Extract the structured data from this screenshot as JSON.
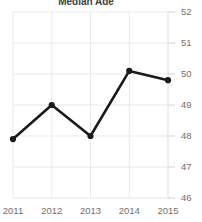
{
  "chart_data": {
    "type": "line",
    "title": "Median Age",
    "categories": [
      "2011",
      "2012",
      "2013",
      "2014",
      "2015"
    ],
    "x": [
      2011,
      2012,
      2013,
      2014,
      2015
    ],
    "values": [
      47.9,
      49.0,
      48.0,
      50.1,
      49.8
    ],
    "series": [
      {
        "name": "Median Age",
        "values": [
          47.9,
          49.0,
          48.0,
          50.1,
          49.8
        ]
      }
    ],
    "xlabel": "",
    "ylabel": "",
    "ylim": [
      46,
      52
    ],
    "yticks": [
      46,
      47,
      48,
      49,
      50,
      51,
      52
    ],
    "ytick_labels": [
      "46",
      "47",
      "48",
      "49",
      "50",
      "51",
      "52"
    ],
    "xtick_labels": [
      "2011",
      "2012",
      "2013",
      "2014",
      "2015"
    ],
    "grid": true,
    "grid_axis": "both",
    "legend": false,
    "legend_position": "none",
    "y_axis_side": "right",
    "marker": "circle",
    "colors": {
      "line": "#1a1a1a",
      "marker": "#1a1a1a",
      "grid": "#e9e9e9",
      "tick_label": "#6f6f6f",
      "title": "#3d3d3d",
      "background": "#ffffff"
    }
  }
}
